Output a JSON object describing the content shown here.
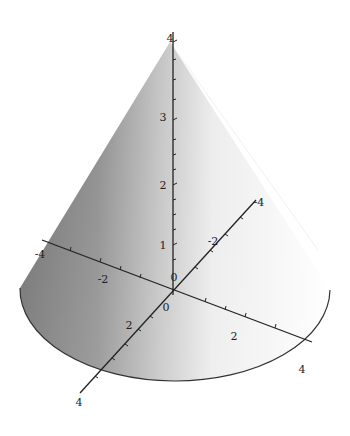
{
  "chart_data": {
    "type": "surface3d",
    "title": "",
    "shape": "cone",
    "surface": "z = 4 - sqrt(x^2 + y^2), 0 <= z <= 4",
    "apex": {
      "x": 0,
      "y": 0,
      "z": 4
    },
    "base_radius": 4,
    "axes": {
      "x": {
        "ticks": [
          "-4",
          "-2",
          "2",
          "4"
        ],
        "range": [
          -4,
          4
        ]
      },
      "y": {
        "ticks": [
          "-4",
          "-2",
          "0",
          "2",
          "4"
        ],
        "range": [
          -4,
          4
        ]
      },
      "z": {
        "ticks": [
          "0",
          "1",
          "2",
          "3",
          "4"
        ],
        "range": [
          0,
          4
        ]
      }
    },
    "shading": "grayscale, dark on left fading to white on right",
    "grid": false,
    "legend": null
  },
  "labels": {
    "z": [
      {
        "text": "4",
        "x": 170,
        "y": 38
      },
      {
        "text": "3",
        "x": 163,
        "y": 117
      },
      {
        "text": "2",
        "x": 163,
        "y": 185
      },
      {
        "text": "1",
        "x": 163,
        "y": 245
      },
      {
        "text": "0",
        "x": 174,
        "y": 277
      }
    ],
    "x": [
      {
        "text": "-4",
        "x": 40,
        "y": 254
      },
      {
        "text": "-2",
        "x": 103,
        "y": 279
      },
      {
        "text": "2",
        "x": 234,
        "y": 336
      },
      {
        "text": "4",
        "x": 302,
        "y": 369
      }
    ],
    "y": [
      {
        "text": "4",
        "x": 79,
        "y": 402
      },
      {
        "text": "2",
        "x": 129,
        "y": 325
      },
      {
        "text": "0",
        "x": 166,
        "y": 307
      },
      {
        "text": "-2",
        "x": 213,
        "y": 241
      },
      {
        "text": "-4",
        "x": 259,
        "y": 202
      }
    ]
  }
}
